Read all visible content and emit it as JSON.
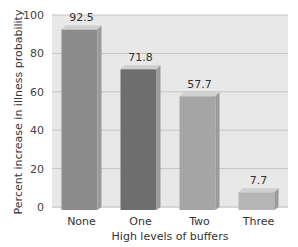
{
  "chart_data": {
    "type": "bar",
    "title": "",
    "xlabel": "High levels of buffers",
    "ylabel": "Percent increase in illness probability",
    "categories": [
      "None",
      "One",
      "Two",
      "Three"
    ],
    "values": [
      92.5,
      71.8,
      57.7,
      7.7
    ],
    "value_labels": [
      "92.5",
      "71.8",
      "57.7",
      "7.7"
    ],
    "yticks": [
      "0",
      "20",
      "40",
      "60",
      "80",
      "100"
    ],
    "ylim": [
      0,
      100
    ],
    "grid": true,
    "legend": null,
    "bar_colors": [
      "#8c8c8c",
      "#6e6e6e",
      "#a6a6a6",
      "#b5b5b5"
    ],
    "plot_background": "#e6e6e6"
  }
}
